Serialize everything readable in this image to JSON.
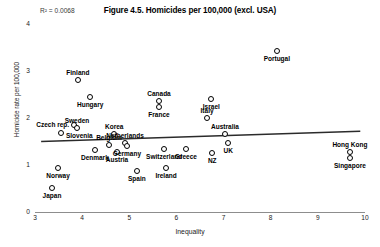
{
  "chart_data": {
    "type": "scatter",
    "title": "Figure 4.5. Homicides per 100,000 (excl. USA)",
    "xlabel": "Inequality",
    "ylabel": "Homicide rate per 100,000",
    "xlim": [
      3,
      10
    ],
    "ylim": [
      0,
      4
    ],
    "xticks": [
      "3",
      "4",
      "5",
      "6",
      "7",
      "8",
      "9",
      "10"
    ],
    "yticks": [
      "0",
      "1",
      "2",
      "3",
      "4"
    ],
    "grid": false,
    "legend": "none",
    "annotation": "R² = 0.0068",
    "r_squared": 0.0068,
    "trendline": {
      "visible": true,
      "x_start": 3.13,
      "y_start": 1.5,
      "x_end": 9.9,
      "y_end": 1.72
    },
    "points": [
      {
        "label": "Japan",
        "x": 3.36,
        "y": 0.51,
        "label_pos": "below"
      },
      {
        "label": "Norway",
        "x": 3.49,
        "y": 0.94,
        "label_pos": "below"
      },
      {
        "label": "Slovenia",
        "x": 3.55,
        "y": 1.68,
        "label_pos": "right"
      },
      {
        "label": "Czech rep.",
        "x": 3.83,
        "y": 1.85,
        "label_pos": "left"
      },
      {
        "label": "Sweden",
        "x": 3.89,
        "y": 1.79,
        "label_pos": "above"
      },
      {
        "label": "Finland",
        "x": 3.91,
        "y": 2.81,
        "label_pos": "above"
      },
      {
        "label": "Hungary",
        "x": 4.17,
        "y": 2.45,
        "label_pos": "below"
      },
      {
        "label": "Denmark",
        "x": 4.27,
        "y": 1.32,
        "label_pos": "below"
      },
      {
        "label": "Belgium",
        "x": 4.57,
        "y": 1.43,
        "label_pos": "above"
      },
      {
        "label": "Korea",
        "x": 4.68,
        "y": 1.66,
        "label_pos": "above"
      },
      {
        "label": "Austria",
        "x": 4.74,
        "y": 1.28,
        "label_pos": "below"
      },
      {
        "label": "Netherlands",
        "x": 4.91,
        "y": 1.47,
        "label_pos": "above"
      },
      {
        "label": "Germany",
        "x": 4.95,
        "y": 1.4,
        "label_pos": "below"
      },
      {
        "label": "Spain",
        "x": 5.16,
        "y": 0.87,
        "label_pos": "below"
      },
      {
        "label": "Canada",
        "x": 5.63,
        "y": 2.36,
        "label_pos": "above"
      },
      {
        "label": "France",
        "x": 5.63,
        "y": 2.23,
        "label_pos": "below"
      },
      {
        "label": "Switzerland",
        "x": 5.74,
        "y": 1.34,
        "label_pos": "below"
      },
      {
        "label": "Ireland",
        "x": 5.78,
        "y": 0.94,
        "label_pos": "below"
      },
      {
        "label": "Greece",
        "x": 6.2,
        "y": 1.34,
        "label_pos": "below"
      },
      {
        "label": "Italy",
        "x": 6.65,
        "y": 2.0,
        "label_pos": "above"
      },
      {
        "label": "Israel",
        "x": 6.74,
        "y": 2.4,
        "label_pos": "below"
      },
      {
        "label": "NZ",
        "x": 6.76,
        "y": 1.26,
        "label_pos": "below"
      },
      {
        "label": "Australia",
        "x": 7.03,
        "y": 1.66,
        "label_pos": "above"
      },
      {
        "label": "UK",
        "x": 7.1,
        "y": 1.47,
        "label_pos": "below"
      },
      {
        "label": "Portugal",
        "x": 8.13,
        "y": 3.43,
        "label_pos": "below"
      },
      {
        "label": "Hong Kong",
        "x": 9.68,
        "y": 1.28,
        "label_pos": "above"
      },
      {
        "label": "Singapore",
        "x": 9.68,
        "y": 1.15,
        "label_pos": "below"
      }
    ]
  }
}
